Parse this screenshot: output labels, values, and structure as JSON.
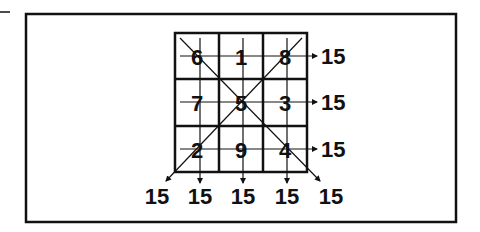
{
  "magic_sum": "15",
  "grid": {
    "rows": [
      [
        "6",
        "1",
        "8"
      ],
      [
        "7",
        "5",
        "3"
      ],
      [
        "2",
        "9",
        "4"
      ]
    ]
  },
  "row_sums": [
    "15",
    "15",
    "15"
  ],
  "bottom_sums": [
    "15",
    "15",
    "15",
    "15",
    "15"
  ],
  "colors": {
    "ink": "#111111",
    "background": "#ffffff"
  }
}
